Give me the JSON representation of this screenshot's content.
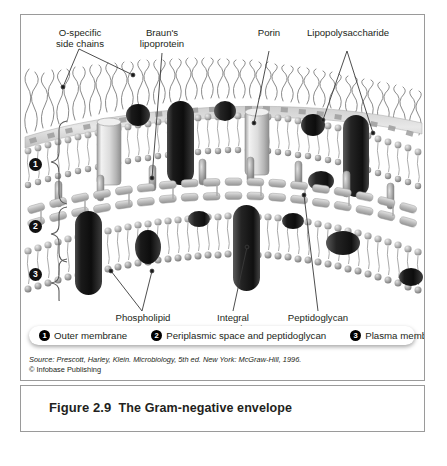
{
  "figure": {
    "number": "Figure 2.9",
    "title": "The Gram-negative envelope"
  },
  "labels": {
    "top": [
      {
        "id": "o-specific-side-chains",
        "line1": "O-specific",
        "line2": "side chains"
      },
      {
        "id": "brauns-lipoprotein",
        "line1": "Braun's",
        "line2": "lipoprotein"
      },
      {
        "id": "porin",
        "line1": "Porin",
        "line2": ""
      },
      {
        "id": "lipopolysaccharide",
        "line1": "Lipopolysaccharide",
        "line2": ""
      }
    ],
    "bottom": [
      {
        "id": "phospholipid",
        "line1": "Phospholipid",
        "line2": ""
      },
      {
        "id": "integral-protein",
        "line1": "Integral",
        "line2": "protein"
      },
      {
        "id": "peptidoglycan",
        "line1": "Peptidoglycan",
        "line2": ""
      }
    ]
  },
  "layers": [
    {
      "num": "1",
      "name": "Outer membrane"
    },
    {
      "num": "2",
      "name": "Periplasmic space and peptidoglycan"
    },
    {
      "num": "3",
      "name": "Plasma membrane"
    }
  ],
  "legend": [
    {
      "num": "1",
      "text": "Outer membrane"
    },
    {
      "num": "2",
      "text": "Periplasmic space and peptidoglycan"
    },
    {
      "num": "3",
      "text": "Plasma membrane"
    }
  ],
  "source": {
    "line1": "Source: Prescott, Harley, Klein.  Microbiology, 5th ed.  New York: McGraw-Hill, 1996.",
    "line2": "© Infobase Publishing"
  },
  "colors": {
    "frame_border": "#9a9a9a",
    "text": "#231f20",
    "leader": "#3a3a3a",
    "protein_dark": "#2b2b2b",
    "protein_light": "#d8d8d8",
    "membrane_head": "#b8b8b8",
    "peptidoglycan": "#c4c4c4",
    "background": "#ffffff"
  }
}
